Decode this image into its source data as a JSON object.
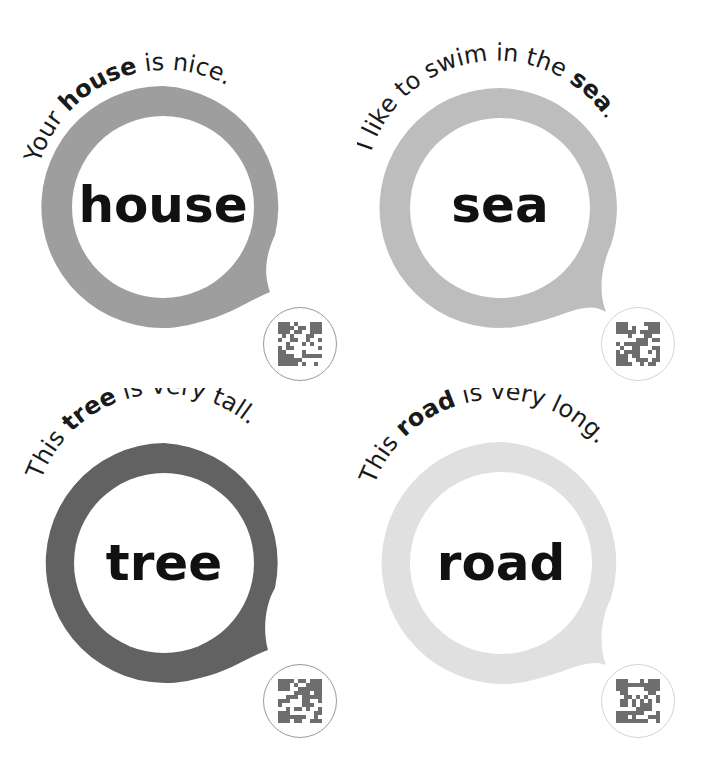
{
  "cards": [
    {
      "id": "house",
      "word": "house",
      "sentence_parts": [
        {
          "text": "Your ",
          "bold": false
        },
        {
          "text": "house",
          "bold": true
        },
        {
          "text": " is nice.",
          "bold": false
        }
      ],
      "sentence": "Your house is nice.",
      "ring_color": "#9e9e9e",
      "qr_label": "qr-code"
    },
    {
      "id": "sea",
      "word": "sea",
      "sentence_parts": [
        {
          "text": "I like to swim in the ",
          "bold": false
        },
        {
          "text": "sea",
          "bold": true
        },
        {
          "text": ".",
          "bold": false
        }
      ],
      "sentence": "I like to swim in the sea.",
      "ring_color": "#bdbdbd",
      "qr_label": "qr-code"
    },
    {
      "id": "tree",
      "word": "tree",
      "sentence_parts": [
        {
          "text": "This ",
          "bold": false
        },
        {
          "text": "tree",
          "bold": true
        },
        {
          "text": " is very tall.",
          "bold": false
        }
      ],
      "sentence": "This tree is very tall.",
      "ring_color": "#626262",
      "qr_label": "qr-code"
    },
    {
      "id": "road",
      "word": "road",
      "sentence_parts": [
        {
          "text": "This ",
          "bold": false
        },
        {
          "text": "road",
          "bold": true
        },
        {
          "text": " is very long.",
          "bold": false
        }
      ],
      "sentence": "This road is very long.",
      "ring_color": "#e0e0e0",
      "qr_label": "qr-code"
    }
  ]
}
